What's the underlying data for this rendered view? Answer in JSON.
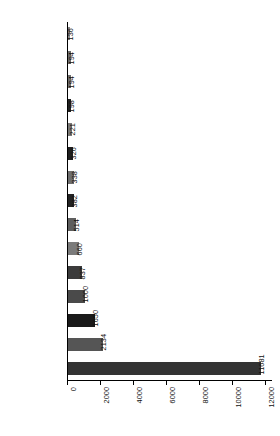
{
  "chart_data": {
    "type": "bar",
    "orientation": "horizontal",
    "title": "",
    "subtitle": "",
    "xlabel": "",
    "ylabel": "",
    "categories": [
      "Nicaragua",
      "Mongolia",
      "Australia",
      "Malawi",
      "Mexico",
      "Nigeria",
      "Guatemala",
      "CAR",
      "Indonesia",
      "South Korea",
      "Peru",
      "Bolivia",
      "Gabon",
      "PNG",
      "Brazil"
    ],
    "values": [
      136,
      194,
      194,
      198,
      221,
      326,
      338,
      382,
      514,
      660,
      837,
      1000,
      1650,
      2134,
      11681
    ],
    "value_labels": [
      "136",
      "194",
      "194",
      "198",
      "221",
      "326",
      "338",
      "382",
      "514",
      "660",
      "837",
      "1000",
      "1650",
      "2134",
      "11681"
    ],
    "bar_colors": [
      "#8a8a8a",
      "#6b6b6b",
      "#6f6f6f",
      "#232323",
      "#7a7a7a",
      "#1f1f1f",
      "#6e6e6e",
      "#232323",
      "#5e5e5e",
      "#7b7b7b",
      "#3b3b3b",
      "#4a4a4a",
      "#1a1a1a",
      "#555555",
      "#333333"
    ],
    "xlim": [
      0,
      12400
    ],
    "xticks": [
      0,
      2000,
      4000,
      6000,
      8000,
      10000,
      12000
    ],
    "xtick_labels": [
      "0",
      "2000",
      "4000",
      "6000",
      "8000",
      "10000",
      "12000"
    ],
    "grid": false,
    "legend": null
  }
}
